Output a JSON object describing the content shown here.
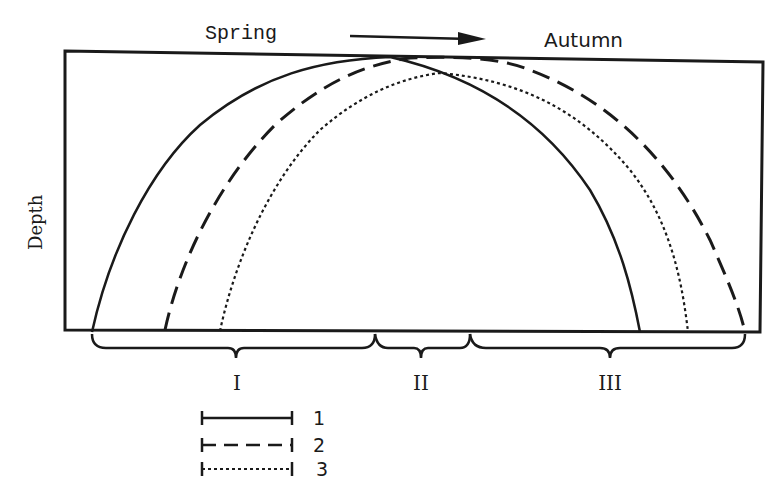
{
  "diagram": {
    "type": "seasonal-depth-profile",
    "top_labels": {
      "left": "Spring",
      "right": "Autumn",
      "arrow_direction": "left-to-right"
    },
    "y_axis_label": "Depth",
    "curves": [
      {
        "id": "1",
        "style": "solid",
        "start_x": 92,
        "peak_x": 390,
        "end_x": 640
      },
      {
        "id": "2",
        "style": "dashed",
        "start_x": 165,
        "peak_x": 470,
        "end_x": 745
      },
      {
        "id": "3",
        "style": "dotted",
        "start_x": 220,
        "peak_x": 440,
        "end_x": 688
      }
    ],
    "zones": [
      {
        "label": "I",
        "from_x": 92,
        "to_x": 375
      },
      {
        "label": "II",
        "from_x": 375,
        "to_x": 470
      },
      {
        "label": "III",
        "from_x": 470,
        "to_x": 745
      }
    ],
    "legend": [
      {
        "style": "solid",
        "label": "1"
      },
      {
        "style": "dashed",
        "label": "2"
      },
      {
        "style": "dotted",
        "label": "3"
      }
    ],
    "colors": {
      "ink": "#1a1a1a",
      "background": "#ffffff"
    }
  }
}
